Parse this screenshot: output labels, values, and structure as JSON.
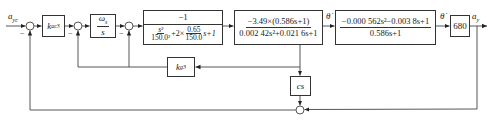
{
  "diagram": {
    "type": "control-block-diagram",
    "input": {
      "symbol": "a",
      "subscript": "yc"
    },
    "output": {
      "symbol": "a",
      "subscript": "y"
    },
    "blocks": {
      "k_ac3": {
        "symbol": "k",
        "subscript": "ac3"
      },
      "integrator": {
        "numerator_symbol": "ω",
        "numerator_subscript": "s",
        "denominator": "s"
      },
      "actuator": {
        "numerator": "−1",
        "den_term1_num": "s²",
        "den_term1_den": "150.0²",
        "den_mid": "+2×",
        "den_term2_num": "0.65",
        "den_term2_den": "150.0",
        "den_tail": "s+1"
      },
      "airframe_rate": {
        "numerator": "−3.49×(0.586s+1)",
        "denominator": "0.002 42s²+0.021 6s+1"
      },
      "airframe_accel": {
        "numerator": "−0.000 562s²−0.003 8s+1",
        "denominator": "0.586s+1"
      },
      "gain_680": {
        "label": "680"
      },
      "k_g3": {
        "symbol": "k",
        "subscript": "g3"
      },
      "cs": {
        "label": "cs"
      }
    },
    "signals": {
      "theta_dot_1": "θ̇",
      "theta_dot_2": "θ̇"
    },
    "signs": {
      "sum1_minus": "−",
      "sum2_minus": "−",
      "sum3_minus": "−"
    }
  }
}
